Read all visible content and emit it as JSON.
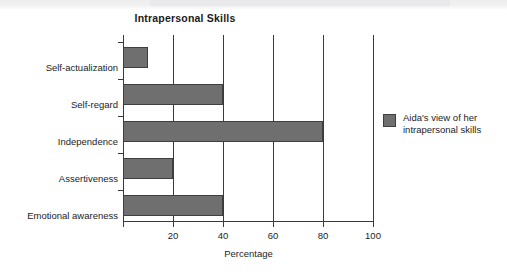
{
  "chart_data": {
    "type": "bar",
    "orientation": "horizontal",
    "title": "Intrapersonal Skills",
    "xlabel": "Percentage",
    "ylabel": "",
    "xlim": [
      0,
      100
    ],
    "xticks": [
      20,
      40,
      60,
      80,
      100
    ],
    "xtick_labels": [
      "20",
      "40",
      "60",
      "80",
      "100"
    ],
    "grid": "vertical",
    "legend_position": "right",
    "categories": [
      "Self-actualization",
      "Self-regard",
      "Independence",
      "Assertiveness",
      "Emotional awareness"
    ],
    "values": [
      10,
      40,
      80,
      20,
      40
    ],
    "series": [
      {
        "name": "Aida's view of her intrapersonal skills",
        "color": "#6f6f6f",
        "values": [
          10,
          40,
          80,
          20,
          40
        ]
      }
    ],
    "legend": [
      {
        "label_line1": "Aida's view of her",
        "label_line2": "intrapersonal skills",
        "color": "#6f6f6f"
      }
    ]
  }
}
